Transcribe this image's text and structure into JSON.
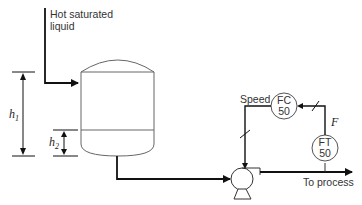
{
  "diagram": {
    "type": "process-control-schematic",
    "inlet_label_line1": "Hot saturated",
    "inlet_label_line2": "liquid",
    "level_h1": "h",
    "level_h1_sub": "1",
    "level_h2": "h",
    "level_h2_sub": "2",
    "speed_label": "Speed",
    "controller": {
      "tag": "FC",
      "number": "50"
    },
    "transmitter": {
      "tag": "FT",
      "number": "50"
    },
    "flow_label": "F",
    "outlet_label": "To process",
    "components": [
      "vessel",
      "pump",
      "flow-controller",
      "flow-transmitter"
    ]
  }
}
